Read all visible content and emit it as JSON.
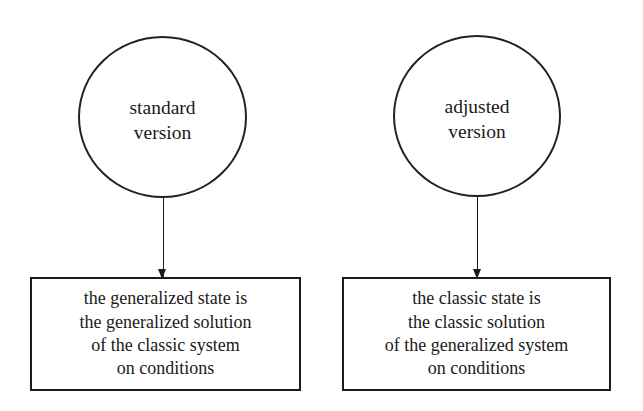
{
  "diagram": {
    "background_color": "#ffffff",
    "stroke_color": "#1b1b1b",
    "text_color": "#1a1a1a",
    "nodes": [
      {
        "id": "circle-standard",
        "shape": "ellipse",
        "lines": [
          "standard",
          "version"
        ]
      },
      {
        "id": "circle-adjusted",
        "shape": "ellipse",
        "lines": [
          "adjusted",
          "version"
        ]
      },
      {
        "id": "box-generalized",
        "shape": "rectangle",
        "lines": [
          "the generalized state is",
          "the generalized solution",
          "of the classic system",
          "on conditions"
        ]
      },
      {
        "id": "box-classic",
        "shape": "rectangle",
        "lines": [
          "the classic state is",
          "the classic solution",
          "of the generalized system",
          "on conditions"
        ]
      }
    ],
    "edges": [
      {
        "id": "arrow-left",
        "from": "circle-standard",
        "to": "box-generalized",
        "direction": "down",
        "style": "solid-with-filled-arrowhead"
      },
      {
        "id": "arrow-right",
        "from": "circle-adjusted",
        "to": "box-classic",
        "direction": "down",
        "style": "solid-with-filled-arrowhead"
      }
    ]
  }
}
